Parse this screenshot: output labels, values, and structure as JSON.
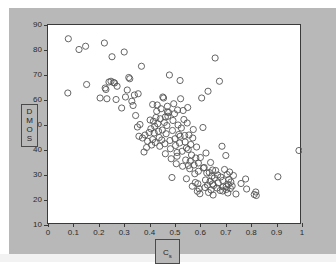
{
  "figure": {
    "background_color": "#b8b8b8",
    "plot_background_color": "#ffffff",
    "axis_color": "#3a3a3a",
    "marker_color": "#555555"
  },
  "ylabel": {
    "text": "DMOS",
    "letters": [
      "D",
      "M",
      "O",
      "S"
    ]
  },
  "xlabel": {
    "base": "C",
    "subscript": "s"
  },
  "chart_data": {
    "type": "scatter",
    "title": "",
    "xlabel": "Cs",
    "ylabel": "DMOS",
    "xlim": [
      0,
      1
    ],
    "ylim": [
      10,
      90
    ],
    "xticks": [
      0,
      0.1,
      0.2,
      0.3,
      0.4,
      0.5,
      0.6,
      0.7,
      0.8,
      0.9,
      1
    ],
    "yticks": [
      10,
      20,
      30,
      40,
      50,
      60,
      70,
      80,
      90
    ],
    "xticklabels": [
      "0",
      "0.1",
      "0.2",
      "0.3",
      "0.4",
      "0.5",
      "0.6",
      "0.7",
      "0.8",
      "0.9",
      "1"
    ],
    "yticklabels": [
      "10",
      "20",
      "30",
      "40",
      "50",
      "60",
      "70",
      "80",
      "90"
    ],
    "grid": false,
    "legend": null,
    "marker": "open-circle",
    "marker_size": 4,
    "series": [
      {
        "name": "observations",
        "x": [
          0.08,
          0.078,
          0.122,
          0.148,
          0.152,
          0.205,
          0.222,
          0.225,
          0.228,
          0.232,
          0.24,
          0.248,
          0.252,
          0.258,
          0.262,
          0.268,
          0.272,
          0.29,
          0.3,
          0.305,
          0.312,
          0.318,
          0.322,
          0.33,
          0.335,
          0.34,
          0.345,
          0.352,
          0.358,
          0.362,
          0.368,
          0.372,
          0.378,
          0.382,
          0.388,
          0.392,
          0.398,
          0.402,
          0.405,
          0.408,
          0.412,
          0.415,
          0.418,
          0.42,
          0.422,
          0.425,
          0.428,
          0.43,
          0.432,
          0.435,
          0.438,
          0.44,
          0.442,
          0.445,
          0.448,
          0.45,
          0.452,
          0.455,
          0.458,
          0.46,
          0.462,
          0.465,
          0.468,
          0.47,
          0.472,
          0.475,
          0.478,
          0.48,
          0.482,
          0.485,
          0.488,
          0.49,
          0.492,
          0.495,
          0.498,
          0.5,
          0.502,
          0.505,
          0.508,
          0.51,
          0.512,
          0.515,
          0.518,
          0.52,
          0.522,
          0.525,
          0.528,
          0.53,
          0.532,
          0.535,
          0.538,
          0.54,
          0.542,
          0.545,
          0.548,
          0.55,
          0.552,
          0.555,
          0.558,
          0.56,
          0.562,
          0.565,
          0.568,
          0.57,
          0.572,
          0.575,
          0.578,
          0.58,
          0.582,
          0.585,
          0.588,
          0.59,
          0.592,
          0.595,
          0.598,
          0.6,
          0.605,
          0.61,
          0.615,
          0.618,
          0.62,
          0.622,
          0.625,
          0.628,
          0.63,
          0.632,
          0.635,
          0.638,
          0.64,
          0.642,
          0.645,
          0.648,
          0.65,
          0.652,
          0.655,
          0.658,
          0.66,
          0.665,
          0.668,
          0.67,
          0.675,
          0.678,
          0.68,
          0.685,
          0.688,
          0.69,
          0.695,
          0.7,
          0.702,
          0.705,
          0.708,
          0.71,
          0.712,
          0.715,
          0.718,
          0.72,
          0.725,
          0.73,
          0.74,
          0.76,
          0.778,
          0.782,
          0.812,
          0.818,
          0.82,
          0.905,
          0.988,
          0.47,
          0.52,
          0.545,
          0.592,
          0.612,
          0.648,
          0.688,
          0.702,
          0.355,
          0.412,
          0.462,
          0.508,
          0.553
        ],
        "y": [
          84.5,
          62.8,
          80.2,
          81.5,
          66.2,
          60.8,
          82.8,
          64.8,
          64.2,
          60.5,
          67.2,
          67.5,
          77.3,
          67.0,
          66.8,
          60.2,
          65.5,
          56.8,
          79.2,
          61.2,
          64.0,
          69.0,
          68.5,
          59.5,
          57.8,
          62.0,
          53.8,
          49.2,
          45.5,
          50.2,
          73.5,
          44.8,
          39.2,
          46.0,
          41.0,
          43.5,
          47.0,
          52.0,
          48.5,
          42.0,
          44.2,
          51.5,
          46.8,
          49.5,
          43.0,
          53.0,
          55.5,
          58.0,
          50.5,
          47.5,
          45.0,
          41.5,
          52.5,
          56.5,
          44.0,
          48.0,
          61.2,
          60.8,
          51.0,
          42.5,
          38.5,
          46.5,
          49.8,
          57.5,
          53.5,
          55.0,
          70.0,
          43.8,
          40.5,
          36.5,
          29.0,
          47.8,
          51.8,
          58.5,
          54.5,
          44.5,
          41.8,
          34.5,
          37.5,
          56.0,
          50.0,
          46.2,
          42.8,
          67.8,
          60.5,
          48.8,
          39.5,
          33.5,
          55.8,
          52.2,
          45.8,
          43.2,
          36.0,
          28.5,
          50.8,
          57.0,
          40.2,
          46.0,
          32.5,
          35.5,
          42.2,
          38.0,
          25.5,
          44.8,
          48.2,
          34.0,
          30.5,
          27.0,
          36.8,
          41.2,
          23.5,
          26.5,
          31.5,
          24.5,
          22.5,
          37.0,
          60.8,
          49.0,
          33.0,
          25.0,
          28.0,
          38.8,
          30.8,
          26.0,
          63.5,
          23.0,
          31.0,
          27.5,
          35.0,
          24.0,
          29.5,
          32.0,
          22.0,
          25.8,
          28.8,
          76.8,
          31.8,
          24.8,
          30.0,
          26.8,
          67.5,
          23.8,
          29.2,
          41.5,
          27.8,
          25.2,
          32.2,
          37.8,
          24.2,
          30.2,
          22.8,
          26.2,
          28.2,
          31.2,
          24.6,
          27.2,
          25.6,
          29.8,
          22.4,
          26.6,
          28.4,
          24.4,
          22.2,
          23.2,
          21.8,
          29.3,
          39.8,
          55.2,
          45.5,
          40.8,
          34.8,
          32.8,
          26.4,
          23.6,
          25.4,
          62.5,
          58.2,
          53.2,
          39.0,
          33.8
        ]
      }
    ]
  }
}
